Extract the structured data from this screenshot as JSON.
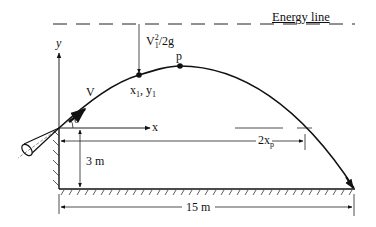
{
  "diagram": {
    "type": "projectile water jet from nozzle",
    "energy_line": {
      "label": "Energy line"
    },
    "axes": {
      "x_label": "x",
      "y_label": "y"
    },
    "angle_label": "θ",
    "velocity_label": "V",
    "velocity_head": {
      "base": "V",
      "sub": "1",
      "sup": "2",
      "rest": "/2g"
    },
    "point_1": {
      "x": "x",
      "x_sub": "1",
      "sep": ", ",
      "y": "y",
      "y_sub": "1"
    },
    "peak_label": "p",
    "dimensions": {
      "height": "3 m",
      "span_2xp": {
        "base": "2x",
        "sub": "p"
      },
      "range": "15 m"
    },
    "colors": {
      "ink": "#111111",
      "background": "#ffffff"
    }
  }
}
